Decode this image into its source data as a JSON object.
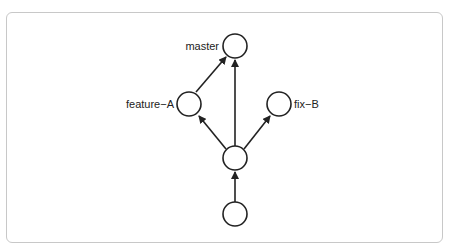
{
  "diagram": {
    "type": "git-branch-graph",
    "nodes": [
      {
        "id": "master",
        "label": "master",
        "label_side": "left"
      },
      {
        "id": "feature-A",
        "label": "feature−A",
        "label_side": "left"
      },
      {
        "id": "fix-B",
        "label": "fix−B",
        "label_side": "right"
      },
      {
        "id": "commit-mid",
        "label": ""
      },
      {
        "id": "commit-base",
        "label": ""
      }
    ],
    "edges": [
      {
        "from": "commit-base",
        "to": "commit-mid"
      },
      {
        "from": "commit-mid",
        "to": "feature-A"
      },
      {
        "from": "commit-mid",
        "to": "master"
      },
      {
        "from": "commit-mid",
        "to": "fix-B"
      },
      {
        "from": "feature-A",
        "to": "master"
      }
    ],
    "colors": {
      "stroke": "#222222",
      "frame": "#c8c8c8",
      "background": "#ffffff"
    }
  }
}
